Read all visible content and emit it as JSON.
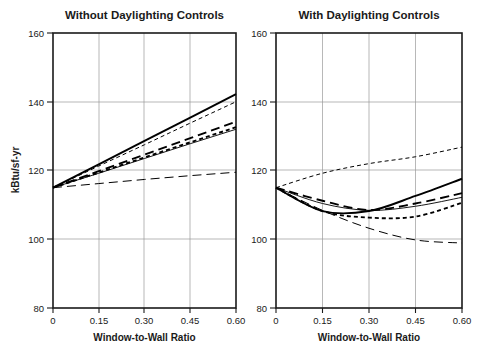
{
  "figure": {
    "width": 485,
    "height": 349,
    "background": "#ffffff",
    "line_color": "#000000",
    "grid_color": "#9a9a9a",
    "axis_color": "#1a1a1a"
  },
  "chart_data": [
    {
      "type": "line",
      "title": "Without Daylighting Controls",
      "xlabel": "Window-to-Wall Ratio",
      "ylabel": "kBtu/sf-yr",
      "xlim": [
        0,
        0.6
      ],
      "ylim": [
        80,
        160
      ],
      "xticks": [
        0,
        0.15,
        0.3,
        0.45,
        0.6
      ],
      "xticklabels": [
        "0",
        "0.15",
        "0.30",
        "0.45",
        "0.60"
      ],
      "yticks": [
        80,
        100,
        120,
        140,
        160
      ],
      "yticklabels": [
        "80",
        "100",
        "120",
        "140",
        "160"
      ],
      "grid": true,
      "legend": "none",
      "x": [
        0,
        0.15,
        0.3,
        0.45,
        0.6
      ],
      "series": [
        {
          "name": "series-1",
          "style": "solid-thick",
          "values": [
            115.0,
            121.8,
            128.6,
            135.4,
            142.2
          ]
        },
        {
          "name": "series-2",
          "style": "shortdash-thin",
          "values": [
            115.0,
            121.3,
            127.5,
            133.8,
            140.0
          ]
        },
        {
          "name": "series-3",
          "style": "longdash-thick",
          "values": [
            115.0,
            119.8,
            124.6,
            129.4,
            134.2
          ]
        },
        {
          "name": "series-4",
          "style": "shortdash-thick",
          "values": [
            115.0,
            119.4,
            123.8,
            128.2,
            132.6
          ]
        },
        {
          "name": "series-5",
          "style": "solid-thin",
          "values": [
            115.0,
            119.2,
            123.5,
            127.8,
            132.0
          ]
        },
        {
          "name": "series-6",
          "style": "longdash-thin",
          "values": [
            115.0,
            116.2,
            117.4,
            118.5,
            119.5
          ]
        }
      ]
    },
    {
      "type": "line",
      "title": "With Daylighting Controls",
      "xlabel": "Window-to-Wall Ratio",
      "ylabel": "kBtu/sf-yr",
      "xlim": [
        0,
        0.6
      ],
      "ylim": [
        80,
        160
      ],
      "xticks": [
        0,
        0.15,
        0.3,
        0.45,
        0.6
      ],
      "xticklabels": [
        "0",
        "0.15",
        "0.30",
        "0.45",
        "0.60"
      ],
      "yticks": [
        80,
        100,
        120,
        140,
        160
      ],
      "yticklabels": [
        "80",
        "100",
        "120",
        "140",
        "160"
      ],
      "grid": true,
      "legend": "none",
      "x": [
        0,
        0.15,
        0.3,
        0.45,
        0.6
      ],
      "series": [
        {
          "name": "series-1",
          "style": "shortdash-thin",
          "values": [
            115.0,
            119.2,
            122.0,
            124.0,
            126.8
          ]
        },
        {
          "name": "series-2",
          "style": "solid-thick",
          "values": [
            115.0,
            108.2,
            108.2,
            112.6,
            117.6
          ]
        },
        {
          "name": "series-3",
          "style": "longdash-thick",
          "values": [
            115.0,
            111.2,
            108.5,
            110.4,
            113.4
          ]
        },
        {
          "name": "series-4",
          "style": "solid-thin",
          "values": [
            115.0,
            110.4,
            108.4,
            109.6,
            112.2
          ]
        },
        {
          "name": "series-5",
          "style": "shortdash-thick",
          "values": [
            115.0,
            108.2,
            106.3,
            106.6,
            110.6
          ]
        },
        {
          "name": "series-6",
          "style": "longdash-thin",
          "values": [
            115.0,
            108.4,
            103.2,
            99.8,
            98.9
          ]
        }
      ]
    }
  ]
}
